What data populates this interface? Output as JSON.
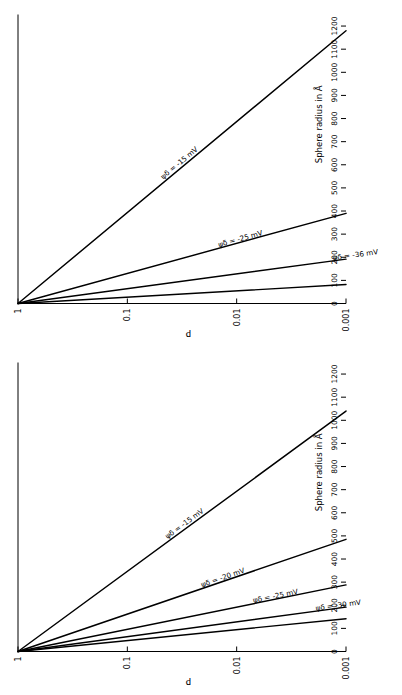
{
  "figure": {
    "background": "#ffffff",
    "line_color": "#000000",
    "axis_color": "#000000"
  },
  "axes": {
    "x": {
      "label": "Sphere radius in Å",
      "ticks": [
        0,
        100,
        200,
        300,
        400,
        500,
        600,
        700,
        800,
        900,
        1000,
        1100,
        1200
      ],
      "tick_labels": [
        "0",
        "100",
        "200",
        "300",
        "400",
        "500",
        "600",
        "700",
        "800",
        "900",
        "1000",
        "1100",
        "1200"
      ],
      "min": 0,
      "max": 1250
    },
    "y": {
      "label": "P",
      "scale": "log",
      "ticks": [
        1,
        0.1,
        0.01,
        0.001
      ],
      "tick_labels": [
        "1",
        "0.1",
        "0.01",
        "0.001"
      ],
      "min": 0.001,
      "max": 1
    }
  },
  "panels": [
    {
      "id": "panel-top",
      "name": "upper-chart",
      "chart_data": {
        "type": "line",
        "title": "",
        "subtitle": "",
        "xlabel": "Sphere radius in Å",
        "ylabel": "P",
        "xlim": [
          0,
          1250
        ],
        "ylim": [
          0.001,
          1
        ],
        "yscale": "log",
        "grid": false,
        "legend": "inline-annotations",
        "series": [
          {
            "name": "ψδ = -15 mV",
            "label": "ψδ = -15 mV",
            "label_position_x": 600,
            "x": [
              0,
              1180
            ],
            "y": [
              1,
              0.001
            ]
          },
          {
            "name": "ψδ = -25 mV",
            "label": "ψδ = -25 mV",
            "label_position_x": 270,
            "x": [
              0,
              390
            ],
            "y": [
              1,
              0.001
            ]
          },
          {
            "name": "ψδ = -36 mV",
            "label": "ψδ = -36 mV",
            "label_position_x": 200,
            "x": [
              0,
              192
            ],
            "y": [
              1,
              0.001
            ]
          },
          {
            "name": "ψδ = -56 mV",
            "label": "ψδ =-56 mV",
            "label_position_x": 130,
            "x": [
              0,
              82
            ],
            "y": [
              1,
              0.001
            ]
          }
        ]
      }
    },
    {
      "id": "panel-bottom",
      "name": "lower-chart",
      "chart_data": {
        "type": "line",
        "title": "",
        "subtitle": "",
        "xlabel": "Sphere radius in Å",
        "ylabel": "P",
        "xlim": [
          0,
          1250
        ],
        "ylim": [
          0.001,
          1
        ],
        "yscale": "log",
        "grid": false,
        "legend": "inline-annotations",
        "series": [
          {
            "name": "ψδ = -15 mV",
            "label": "ψδ = -15 mV",
            "label_position_x": 545,
            "x": [
              0,
              1040
            ],
            "y": [
              1,
              0.001
            ]
          },
          {
            "name": "ψδ = -20 mV",
            "label": "ψδ = -20 mV",
            "label_position_x": 310,
            "x": [
              0,
              485
            ],
            "y": [
              1,
              0.001
            ]
          },
          {
            "name": "ψδ = -25 mV",
            "label": "ψδ = -25 mV",
            "label_position_x": 230,
            "x": [
              0,
              288
            ],
            "y": [
              1,
              0.001
            ]
          },
          {
            "name": "ψδ = -30 mV",
            "label": "ψδ = -30 mV",
            "label_position_x": 190,
            "x": [
              0,
              192
            ],
            "y": [
              1,
              0.001
            ]
          },
          {
            "name": "ψδ = -35 mV",
            "label": "ψδ = -35 mV",
            "label_position_x": 330,
            "x": [
              0,
              142
            ],
            "y": [
              1,
              0.001
            ]
          }
        ]
      }
    }
  ]
}
